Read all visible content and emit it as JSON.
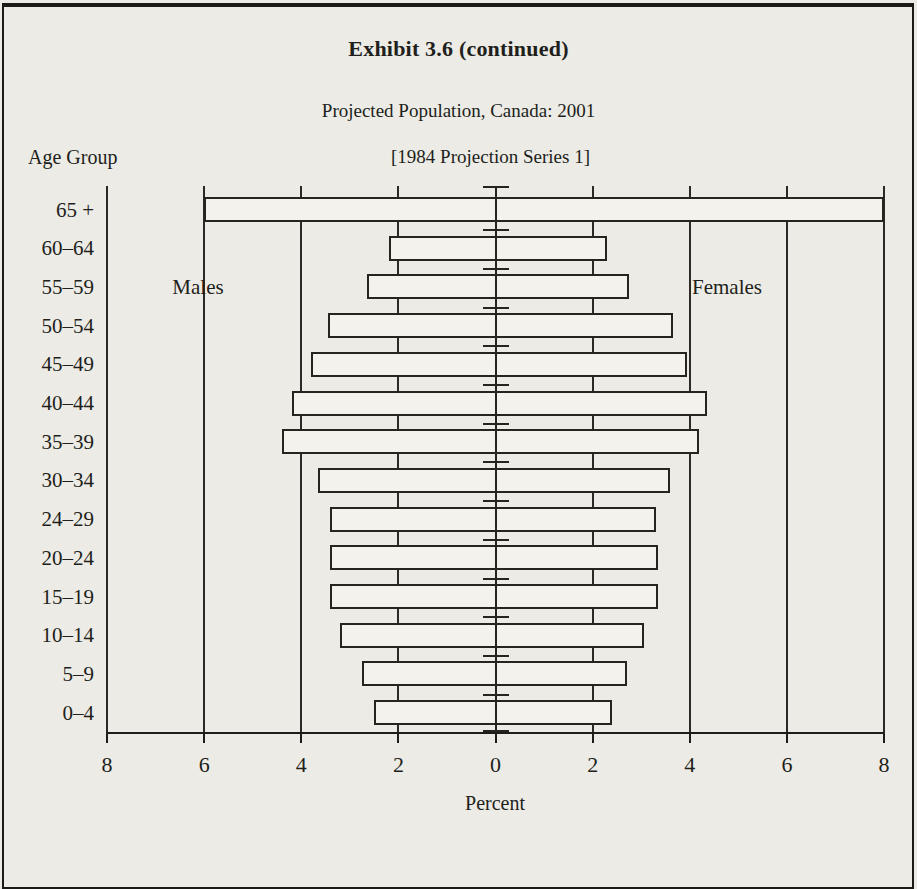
{
  "page": {
    "exhibit_title": "Exhibit 3.6 (continued)",
    "chart_title": "Projected Population, Canada: 2001",
    "chart_subtitle": "[1984 Projection Series 1]",
    "y_axis_title": "Age Group",
    "x_axis_title": "Percent",
    "left_series_label": "Males",
    "right_series_label": "Females"
  },
  "chart_data": {
    "type": "bar",
    "subtype": "population-pyramid",
    "title": "Projected Population, Canada: 2001",
    "subtitle": "[1984 Projection Series 1]",
    "xlabel": "Percent",
    "ylabel": "Age Group",
    "categories": [
      "65 +",
      "60–64",
      "55–59",
      "50–54",
      "45–49",
      "40–44",
      "35–39",
      "30–34",
      "24–29",
      "20–24",
      "15–19",
      "10–14",
      "5–9",
      "0–4"
    ],
    "series": [
      {
        "name": "Males",
        "side": "left",
        "values": [
          6.0,
          2.2,
          2.65,
          3.45,
          3.8,
          4.2,
          4.4,
          3.65,
          3.4,
          3.4,
          3.4,
          3.2,
          2.75,
          2.5
        ]
      },
      {
        "name": "Females",
        "side": "right",
        "values": [
          8.0,
          2.3,
          2.75,
          3.65,
          3.95,
          4.35,
          4.2,
          3.6,
          3.3,
          3.35,
          3.35,
          3.05,
          2.7,
          2.4
        ]
      }
    ],
    "x_tick_labels": [
      "8",
      "6",
      "4",
      "2",
      "0",
      "2",
      "4",
      "6",
      "8"
    ],
    "x_tick_values": [
      -8,
      -6,
      -4,
      -2,
      0,
      2,
      4,
      6,
      8
    ],
    "xlim_each_side": 8,
    "gridlines_every": 2,
    "legend_position": "inside-top",
    "colors": {
      "paper": "#edebe6",
      "ink": "#26241f",
      "bar_fill": "#f4f2ed"
    }
  }
}
